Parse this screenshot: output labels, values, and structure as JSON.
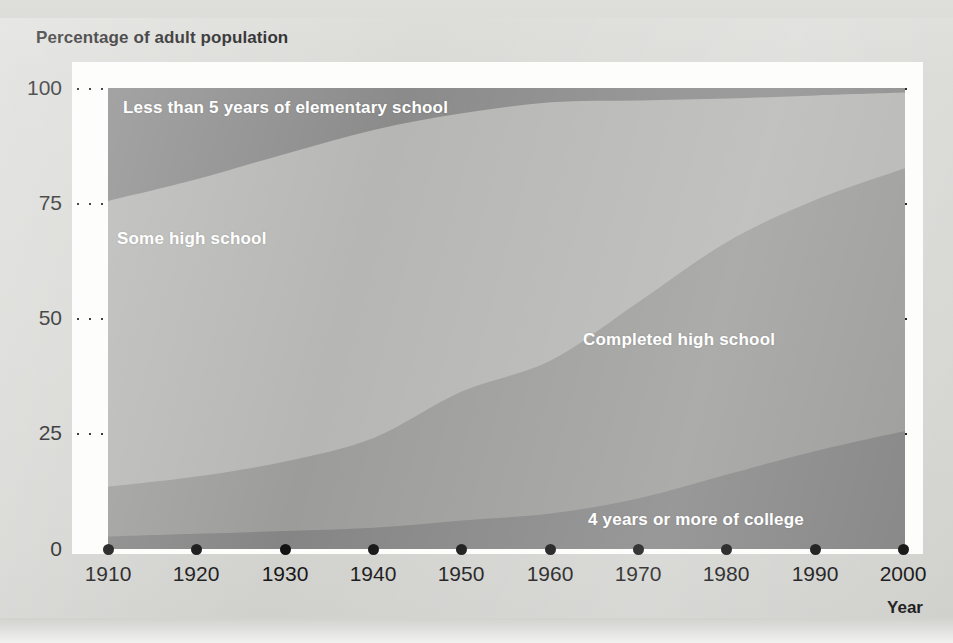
{
  "title": "Percentage of adult population",
  "axes": {
    "x_title": "Year",
    "y_ticks": [
      "100",
      "75",
      "50",
      "25",
      "0"
    ],
    "x_ticks": [
      "1910",
      "1920",
      "1930",
      "1940",
      "1950",
      "1960",
      "1970",
      "1980",
      "1990",
      "2000"
    ]
  },
  "series_labels": {
    "elementary": "Less than 5 years of elementary school",
    "some_high": "Some high school",
    "completed_high": "Completed high school",
    "college": "4 years or more of college"
  },
  "colors": {
    "page_background": "#d6d6d3",
    "plot_background": "#fdfdfc",
    "band_elementary": "#8b8b8b",
    "band_some_high": "#b6b6b4",
    "band_completed_high": "#9c9c9a",
    "band_college": "#858585",
    "gridline": "#161616",
    "text": "#161616",
    "band_label_text": "#ffffff"
  },
  "chart_data": {
    "type": "area",
    "stacked": true,
    "title": "Percentage of adult population",
    "xlabel": "Year",
    "ylabel": "Percentage of adult population",
    "xlim": [
      1910,
      2000
    ],
    "ylim": [
      0,
      100
    ],
    "grid": true,
    "legend": "inline-band-labels",
    "x": [
      1910,
      1920,
      1930,
      1940,
      1950,
      1960,
      1970,
      1980,
      1990,
      2000
    ],
    "series": [
      {
        "name": "4 years or more of college",
        "order": 1,
        "color": "#858585",
        "values": [
          2.7,
          3.3,
          3.9,
          4.6,
          6.2,
          7.7,
          11.0,
          16.2,
          21.3,
          25.6
        ]
      },
      {
        "name": "Completed high school",
        "order": 2,
        "color": "#9c9c9a",
        "values": [
          10.8,
          12.4,
          15.1,
          19.5,
          28.0,
          33.2,
          42.7,
          50.5,
          54.5,
          57.0
        ]
      },
      {
        "name": "Some high school",
        "order": 3,
        "color": "#b6b6b4",
        "values": [
          62.0,
          64.5,
          66.7,
          66.8,
          60.3,
          56.0,
          43.6,
          31.0,
          22.6,
          16.4
        ]
      },
      {
        "name": "Less than 5 years of elementary school",
        "order": 4,
        "color": "#8b8b8b",
        "values": [
          24.5,
          19.8,
          14.3,
          9.1,
          5.5,
          3.1,
          2.7,
          2.3,
          1.6,
          1.0
        ]
      }
    ],
    "cumulative_tops": {
      "college": [
        2.7,
        3.3,
        3.9,
        4.6,
        6.2,
        7.7,
        11.0,
        16.2,
        21.3,
        25.6
      ],
      "completed_high": [
        13.5,
        15.7,
        19.0,
        24.1,
        34.2,
        40.9,
        53.7,
        66.7,
        75.8,
        82.6
      ],
      "some_high": [
        75.5,
        80.2,
        85.7,
        90.9,
        94.5,
        96.9,
        97.3,
        97.7,
        98.4,
        99.0
      ],
      "elementary": [
        100,
        100,
        100,
        100,
        100,
        100,
        100,
        100,
        100,
        100
      ]
    }
  },
  "layout": {
    "plot_left_px": 108,
    "plot_top_px": 88,
    "plot_width_px": 797,
    "plot_height_px": 461
  }
}
